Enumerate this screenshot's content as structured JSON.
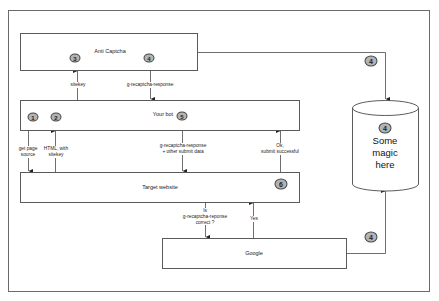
{
  "diagram": {
    "nodes": {
      "anti_captcha": {
        "label": "Anti Captcha",
        "badges": [
          "3",
          "4"
        ]
      },
      "your_bot": {
        "label": "Your bot",
        "badges": [
          "1",
          "2",
          "5"
        ]
      },
      "target_website": {
        "label": "Target website",
        "badges": [
          "6"
        ]
      },
      "google": {
        "label": "Google"
      },
      "magic": {
        "label_lines": [
          "Some",
          "magic",
          "here"
        ],
        "badge": "4"
      }
    },
    "edges": {
      "sitekey": {
        "label": "sitekey"
      },
      "g_recaptcha_response": {
        "label": "g-recaptcha-response"
      },
      "get_page_source": {
        "label_lines": [
          "get page",
          "source"
        ]
      },
      "html_with_sitekey": {
        "label_lines": [
          "HTML, with",
          "sitekey"
        ]
      },
      "submit_data": {
        "label_lines": [
          "g-recaptcha-response",
          "+ other submit data"
        ]
      },
      "ok_submit": {
        "label_lines": [
          "Ok,",
          "submit successful"
        ]
      },
      "is_correct": {
        "label_lines": [
          "Is",
          "g-recaptcha-reponse",
          "correct ?"
        ]
      },
      "yes": {
        "label": "Yes"
      },
      "anti_to_magic_badge": "4",
      "google_to_magic_badge": "4"
    },
    "colors": {
      "line": "#4a4a4a",
      "badge_fill": "#b3b3b3",
      "badge_border": "#444444"
    }
  }
}
